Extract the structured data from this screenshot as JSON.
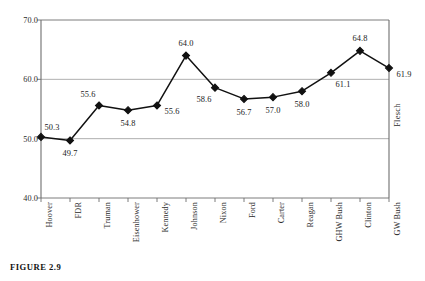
{
  "figure": {
    "caption": "FIGURE 2.9"
  },
  "chart_data": {
    "type": "line",
    "title": "",
    "xlabel": "",
    "ylabel": "",
    "series_name": "Flesch",
    "legend_position": "right-vertical",
    "grid": true,
    "ylim": [
      40.0,
      70.0
    ],
    "ytick_labels": [
      "70.0",
      "60.0",
      "50.0",
      "40.0"
    ],
    "ytick_values": [
      70.0,
      60.0,
      50.0,
      40.0
    ],
    "categories": [
      "Hoover",
      "FDR",
      "Truman",
      "Eisenhower",
      "Kennedy",
      "Johnson",
      "Nixon",
      "Ford",
      "Carter",
      "Reagan",
      "GHW Bush",
      "Clinton",
      "GW Bush"
    ],
    "values": [
      50.3,
      49.7,
      55.6,
      54.8,
      55.6,
      64.0,
      58.6,
      56.7,
      57.0,
      58.0,
      61.1,
      64.8,
      61.9
    ],
    "value_labels": [
      "50.3",
      "49.7",
      "55.6",
      "54.8",
      "55.6",
      "64.0",
      "58.6",
      "56.7",
      "57.0",
      "58.0",
      "61.1",
      "64.8",
      "61.9"
    ],
    "label_placement": [
      "above-right",
      "below",
      "above-left",
      "below",
      "right",
      "above",
      "below-left",
      "below",
      "below",
      "below",
      "below-right",
      "above",
      "right"
    ],
    "marker": "diamond",
    "marker_color": "#111111",
    "line_color": "#111111",
    "grid_color": "#9a9a9a",
    "axis_color": "#6e6e6e"
  }
}
